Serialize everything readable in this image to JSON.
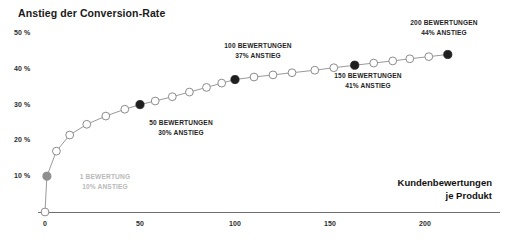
{
  "chart_data": {
    "type": "line",
    "title": "Anstieg der Conversion-Rate",
    "xlabel_line1": "Kundenbewertungen",
    "xlabel_line2": "je Produkt",
    "ylabel": "",
    "xlim": [
      -2,
      222
    ],
    "ylim": [
      0,
      52
    ],
    "grid": false,
    "legend": "none",
    "y_ticks": [
      "10 %",
      "20 %",
      "30 %",
      "40 %",
      "50 %"
    ],
    "y_tick_values": [
      10,
      20,
      30,
      40,
      50
    ],
    "x_ticks": [
      "0",
      "50",
      "100",
      "150",
      "200"
    ],
    "x_tick_values": [
      0,
      50,
      100,
      150,
      200
    ],
    "series": [
      {
        "name": "Anstieg der Conversion-Rate",
        "x": [
          0,
          1,
          6,
          13,
          22,
          32,
          42,
          50,
          58,
          67,
          76,
          85,
          93,
          100,
          110,
          120,
          130,
          142,
          152,
          163,
          173,
          183,
          192,
          202,
          212
        ],
        "values": [
          0,
          10,
          17,
          21.5,
          24.5,
          26.8,
          28.7,
          30,
          31,
          32.2,
          33.5,
          34.8,
          36,
          37,
          37.7,
          38.3,
          38.9,
          39.6,
          40.3,
          41,
          41.6,
          42.2,
          42.8,
          43.4,
          44
        ],
        "highlighted": [
          false,
          true,
          false,
          false,
          false,
          false,
          false,
          true,
          false,
          false,
          false,
          false,
          false,
          true,
          false,
          false,
          false,
          false,
          false,
          true,
          false,
          false,
          false,
          false,
          true
        ]
      }
    ],
    "annotations": [
      {
        "id": "annot-1-rating",
        "line1": "1 BEWERTUNG",
        "line2": "10% ANSTIEG",
        "style": "light",
        "x_px": 105,
        "y_px": 172
      },
      {
        "id": "annot-50-ratings",
        "line1": "50 BEWERTUNGEN",
        "line2": "30% ANSTIEG",
        "style": "dark",
        "x_px": 181,
        "y_px": 118
      },
      {
        "id": "annot-100-ratings",
        "line1": "100 BEWERTUNGEN",
        "line2": "37% ANSTIEG",
        "style": "dark",
        "x_px": 258,
        "y_px": 41
      },
      {
        "id": "annot-150-ratings",
        "line1": "150 BEWERTUNGEN",
        "line2": "41% ANSTIEG",
        "style": "dark",
        "x_px": 368,
        "y_px": 71
      },
      {
        "id": "annot-200-ratings",
        "line1": "200 BEWERTUNGEN",
        "line2": "44% ANSTIEG",
        "style": "dark",
        "x_px": 444,
        "y_px": 18
      }
    ],
    "colors": {
      "line": "#9a9a9a",
      "marker_fill_open": "#ffffff",
      "marker_stroke": "#8c8c8c",
      "marker_highlight_dark": "#1f1f1f",
      "marker_highlight_gray": "#8e8e8e",
      "axis": "#6f6f6f",
      "text_dark": "#1a1a1a",
      "text_light": "#b9b9b9"
    }
  }
}
